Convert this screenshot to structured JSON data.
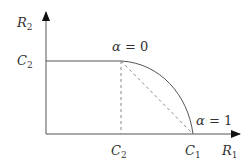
{
  "diagram": {
    "type": "capacity-region",
    "axes": {
      "x": {
        "symbol": "R",
        "sub": "1"
      },
      "y": {
        "symbol": "R",
        "sub": "2"
      }
    },
    "ticks": {
      "y_C2": {
        "symbol": "C",
        "sub": "2"
      },
      "x_C2": {
        "symbol": "C",
        "sub": "2"
      },
      "x_C1": {
        "symbol": "C",
        "sub": "1"
      }
    },
    "annotations": {
      "alpha0": {
        "greek": "α",
        "rest": " = 0"
      },
      "alpha1": {
        "greek": "α",
        "rest": " = 1"
      }
    },
    "colors": {
      "line": "#4a4a4a",
      "dashed": "#777777"
    }
  }
}
